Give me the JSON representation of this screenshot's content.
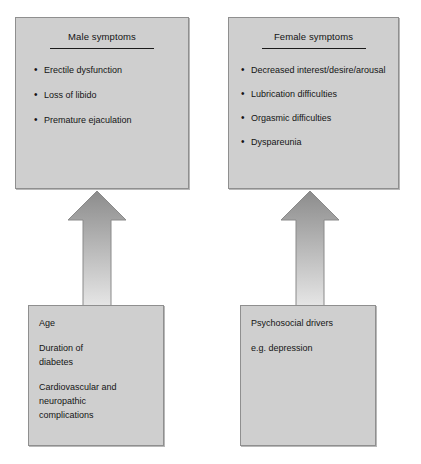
{
  "diagram": {
    "title_rule_color": "#1a1a1a",
    "box_fill": "#cfcfcf",
    "box_border": "#8f8f8f",
    "arrow_top_color": "#8c8c8c",
    "arrow_bottom_color": "#e6e6e6"
  },
  "male_box": {
    "title": "Male symptoms",
    "bullet": "•",
    "symptoms": [
      "Erectile dysfunction",
      "Loss of libido",
      "Premature ejaculation"
    ]
  },
  "female_box": {
    "title": "Female symptoms",
    "bullet": "•",
    "symptoms": [
      "Decreased interest/desire/arousal",
      "Lubrication difficulties",
      "Orgasmic difficulties",
      "Dyspareunia"
    ]
  },
  "left_driver_box": {
    "lines": [
      "Age",
      "Duration of",
      "diabetes",
      "Cardiovascular and",
      "neuropathic",
      "complications"
    ]
  },
  "right_driver_box": {
    "lines": [
      "Psychosocial drivers",
      "e.g. depression"
    ]
  },
  "arrows": [
    {
      "name": "left-up-arrow"
    },
    {
      "name": "right-up-arrow"
    }
  ]
}
